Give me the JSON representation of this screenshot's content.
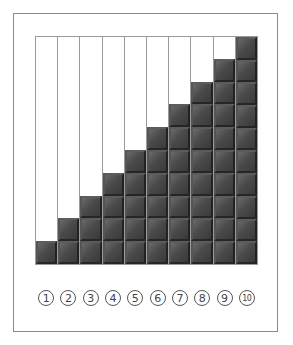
{
  "diagram": {
    "type": "staircase-block-columns",
    "columns": [
      {
        "label": "1",
        "filled": 1
      },
      {
        "label": "2",
        "filled": 2
      },
      {
        "label": "3",
        "filled": 3
      },
      {
        "label": "4",
        "filled": 4
      },
      {
        "label": "5",
        "filled": 5
      },
      {
        "label": "6",
        "filled": 6
      },
      {
        "label": "7",
        "filled": 7
      },
      {
        "label": "8",
        "filled": 8
      },
      {
        "label": "9",
        "filled": 9
      },
      {
        "label": "10",
        "filled": 10
      }
    ],
    "rows": 10,
    "colors": {
      "block": "#4a4a4a",
      "empty": "#ffffff",
      "border": "#8a8a8a"
    }
  }
}
